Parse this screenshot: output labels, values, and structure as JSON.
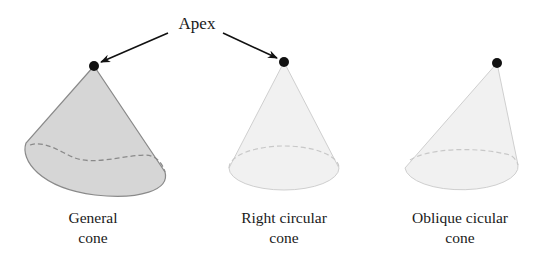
{
  "diagram": {
    "title_label": "Apex",
    "colors": {
      "general_fill": "#d6d6d6",
      "general_stroke": "#8a8a8a",
      "light_fill": "#f1f1f1",
      "light_stroke": "#cfcfcf",
      "apex_dot": "#111111",
      "arrow": "#111111"
    },
    "cones": [
      {
        "name": "General cone",
        "caption_line1": "General",
        "caption_line2": "cone",
        "apex": [
          94,
          66
        ],
        "shaded": true
      },
      {
        "name": "Right circular cone",
        "caption_line1": "Right circular",
        "caption_line2": "cone",
        "apex": [
          284,
          62
        ],
        "shaded": false
      },
      {
        "name": "Oblique cicular cone",
        "caption_line1": "Oblique cicular",
        "caption_line2": "cone",
        "apex": [
          497,
          63
        ],
        "shaded": false
      }
    ],
    "arrows": [
      {
        "from": "Apex",
        "to": "General cone apex"
      },
      {
        "from": "Apex",
        "to": "Right circular cone apex"
      }
    ]
  }
}
